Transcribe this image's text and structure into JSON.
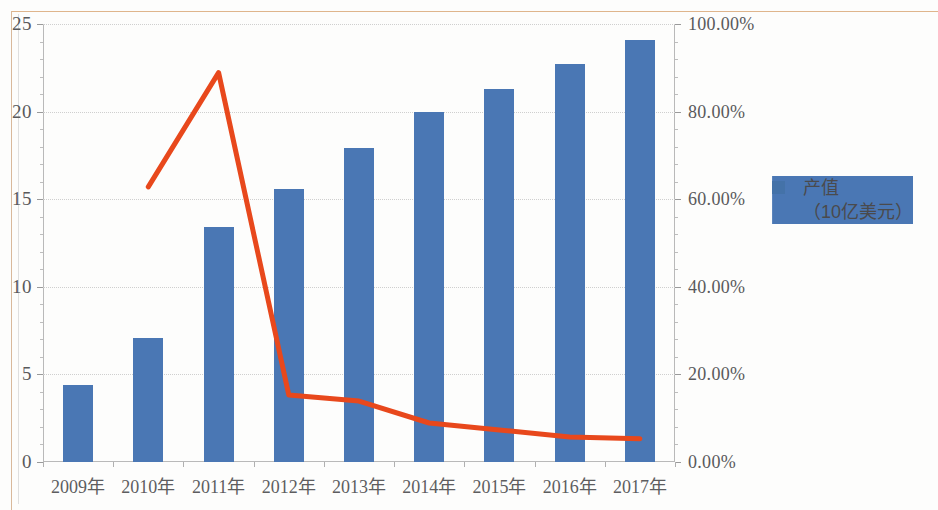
{
  "chart_data": {
    "type": "bar",
    "title": "",
    "xlabel": "",
    "ylabel": "",
    "grid": true,
    "legend_position": "right",
    "categories": [
      "2009年",
      "2010年",
      "2011年",
      "2012年",
      "2013年",
      "2014年",
      "2015年",
      "2016年",
      "2017年"
    ],
    "axes": {
      "left": {
        "ticks": [
          "0",
          "5",
          "10",
          "15",
          "20",
          "25"
        ],
        "values": [
          0,
          5,
          10,
          15,
          20,
          25
        ],
        "ylim": [
          0,
          25
        ],
        "unit": "10亿美元"
      },
      "right": {
        "ticks": [
          "0.00%",
          "20.00%",
          "40.00%",
          "60.00%",
          "80.00%",
          "100.00%"
        ],
        "values": [
          0,
          20,
          40,
          60,
          80,
          100
        ],
        "ylim": [
          0,
          100
        ],
        "unit": "%"
      }
    },
    "series": [
      {
        "name": "产值（10亿美元）",
        "type": "bar",
        "axis": "left",
        "color": "#4a77b4",
        "values": [
          4.4,
          7.1,
          13.4,
          15.6,
          17.9,
          20.0,
          21.3,
          22.7,
          24.1
        ]
      },
      {
        "name": "年增长率",
        "type": "line",
        "axis": "right",
        "color": "#e8481c",
        "values": [
          null,
          62.8,
          88.9,
          15.3,
          13.9,
          8.9,
          7.3,
          5.7,
          5.3
        ]
      }
    ]
  },
  "legend": {
    "items": [
      {
        "label_main": "产值",
        "label_sub": "（10亿美元）",
        "marker": "square-marker",
        "color": "#4472a8"
      },
      {
        "label_main": "年增长率",
        "label_sub": "",
        "marker": "line-marker",
        "color": "#e8481c"
      }
    ]
  }
}
